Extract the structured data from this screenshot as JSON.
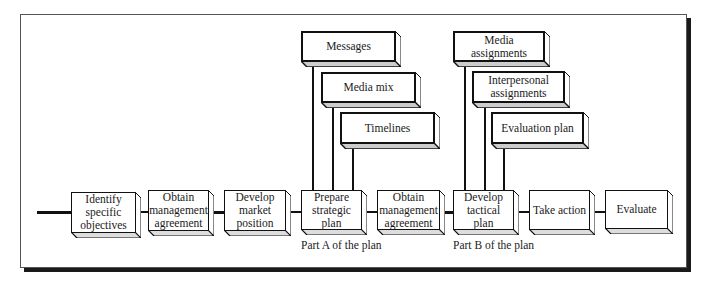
{
  "diagram": {
    "main_flow": [
      {
        "id": "identify",
        "label_lines": [
          "Identify",
          "specific",
          "objectives"
        ]
      },
      {
        "id": "obtain1",
        "label_lines": [
          "Obtain",
          "management",
          "agreement"
        ]
      },
      {
        "id": "develop-market",
        "label_lines": [
          "Develop",
          "market",
          "position"
        ]
      },
      {
        "id": "prepare-strategic",
        "label_lines": [
          "Prepare",
          "strategic plan"
        ]
      },
      {
        "id": "obtain2",
        "label_lines": [
          "Obtain",
          "management",
          "agreement"
        ]
      },
      {
        "id": "develop-tactical",
        "label_lines": [
          "Develop",
          "tactical plan"
        ]
      },
      {
        "id": "take-action",
        "label_lines": [
          "Take action"
        ]
      },
      {
        "id": "evaluate",
        "label_lines": [
          "Evaluate"
        ]
      }
    ],
    "part_a": {
      "caption": "Part A of the plan",
      "components": [
        {
          "label_lines": [
            "Messages"
          ]
        },
        {
          "label_lines": [
            "Media mix"
          ]
        },
        {
          "label_lines": [
            "Timelines"
          ]
        }
      ]
    },
    "part_b": {
      "caption": "Part B of the plan",
      "components": [
        {
          "label_lines": [
            "Media assignments"
          ]
        },
        {
          "label_lines": [
            "Interpersonal",
            "assignments"
          ]
        },
        {
          "label_lines": [
            "Evaluation plan"
          ]
        }
      ]
    }
  }
}
